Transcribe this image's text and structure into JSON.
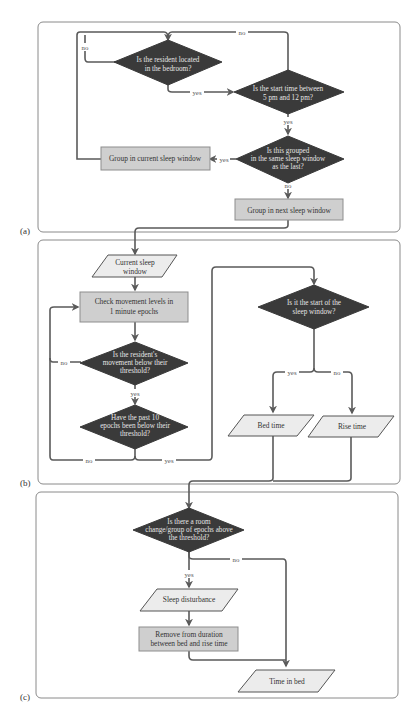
{
  "panels": {
    "a": {
      "label": "(a)"
    },
    "b": {
      "label": "(b)"
    },
    "c": {
      "label": "(c)"
    }
  },
  "a": {
    "q_bedroom": [
      "Is the resident located",
      "in the bedroom?"
    ],
    "q_start": [
      "Is the start time between",
      "5 pm and 12 pm?"
    ],
    "q_grouped": [
      "Is this grouped",
      "in the same sleep window",
      "as the last?"
    ],
    "p_current": "Group in current sleep window",
    "p_next": "Group in next sleep window",
    "e_no_top": "no",
    "e_no_left": "no",
    "e_yes_bed": "yes",
    "e_yes_start": "yes",
    "e_yes_grouped": "yes",
    "e_no_grouped": "no"
  },
  "b": {
    "io_window": [
      "Current sleep",
      "window"
    ],
    "p_check": [
      "Check movement levels in",
      "1 minute epochs"
    ],
    "q_movement": [
      "Is the resident's",
      "movement below their",
      "threshold?"
    ],
    "q_past": [
      "Have the past 10",
      "epochs been below their",
      "threshold?"
    ],
    "q_start": [
      "Is it the start of the",
      "sleep window?"
    ],
    "io_bed": "Bed time",
    "io_rise": "Rise time",
    "e_no_movement": "no",
    "e_yes_movement": "yes",
    "e_no_past": "no",
    "e_yes_past": "yes",
    "e_yes_start": "yes",
    "e_no_start": "no"
  },
  "c": {
    "q_room": [
      "Is there a room",
      "change/group of epochs above",
      "the threshold?"
    ],
    "io_disturbance": "Sleep disturbance",
    "p_remove": [
      "Remove from duration",
      "between bed and rise time"
    ],
    "io_timeinbed": "Time in bed",
    "e_yes": "yes",
    "e_no": "no"
  },
  "colors": {
    "decision": "#3a3a3a",
    "process": "#cfcfcf",
    "io": "#ececec",
    "connector": "#5a5a5a",
    "panel_border": "#8a8a8a"
  }
}
